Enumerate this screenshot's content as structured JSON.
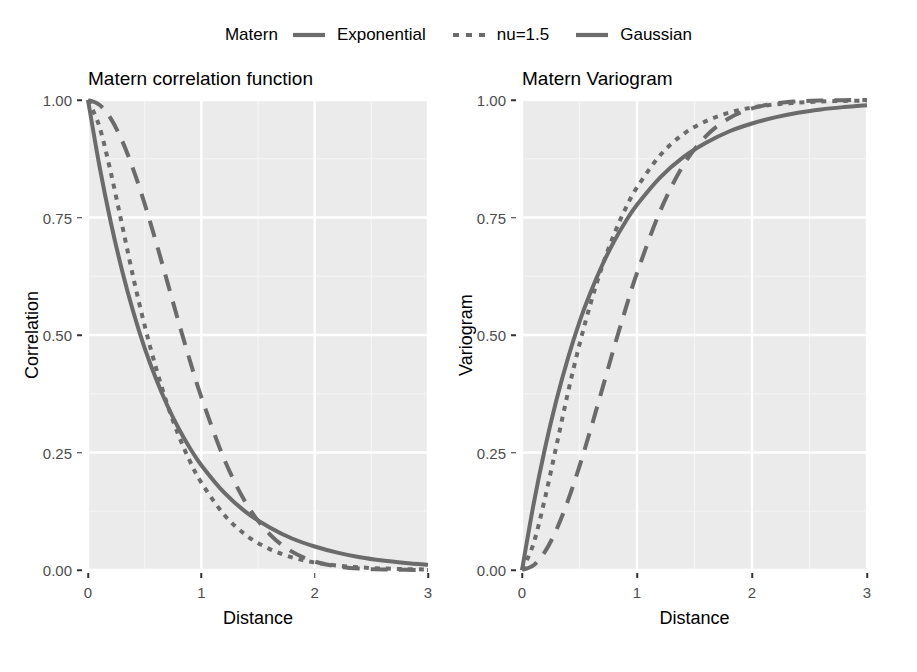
{
  "legend": {
    "title": "Matern",
    "entries": [
      {
        "label": "Exponential",
        "dash": "solid",
        "color": "#6b6b6b"
      },
      {
        "label": "nu=1.5",
        "dash": "dotted",
        "color": "#6b6b6b"
      },
      {
        "label": "Gaussian",
        "dash": "dashed",
        "color": "#6b6b6b"
      }
    ]
  },
  "panels": {
    "left": {
      "title": "Matern correlation function",
      "xlabel": "Distance",
      "ylabel": "Correlation"
    },
    "right": {
      "title": "Matern Variogram",
      "xlabel": "Distance",
      "ylabel": "Variogram"
    }
  },
  "colors": {
    "panel_background": "#ebebeb",
    "grid_major": "#ffffff",
    "grid_minor": "#f5f5f5",
    "line": "#6b6b6b",
    "tick_text": "#4d4d4d",
    "title_text": "#000000"
  },
  "chart_data": [
    {
      "type": "line",
      "title": "Matern correlation function",
      "xlabel": "Distance",
      "ylabel": "Correlation",
      "xlim": [
        0,
        3
      ],
      "ylim": [
        0,
        1
      ],
      "xticks": [
        "0",
        "1",
        "2",
        "3"
      ],
      "xtick_values": [
        0,
        1,
        2,
        3
      ],
      "yticks": [
        "0.00",
        "0.25",
        "0.50",
        "0.75",
        "1.00"
      ],
      "ytick_values": [
        0,
        0.25,
        0.5,
        0.75,
        1
      ],
      "grid": true,
      "legend_position": "top",
      "x": [
        0,
        0.1,
        0.2,
        0.3,
        0.4,
        0.5,
        0.6,
        0.7,
        0.8,
        0.9,
        1.0,
        1.2,
        1.4,
        1.6,
        1.8,
        2.0,
        2.2,
        2.4,
        2.6,
        2.8,
        3.0
      ],
      "series": [
        {
          "name": "Exponential",
          "dash": "solid",
          "values": [
            1.0,
            0.861,
            0.741,
            0.638,
            0.549,
            0.472,
            0.407,
            0.35,
            0.301,
            0.259,
            0.223,
            0.165,
            0.122,
            0.091,
            0.067,
            0.05,
            0.037,
            0.027,
            0.02,
            0.015,
            0.011
          ]
        },
        {
          "name": "nu=1.5",
          "dash": "dotted",
          "values": [
            1.0,
            0.944,
            0.847,
            0.735,
            0.622,
            0.52,
            0.43,
            0.352,
            0.286,
            0.231,
            0.186,
            0.118,
            0.073,
            0.045,
            0.027,
            0.016,
            0.0095,
            0.0056,
            0.0032,
            0.0019,
            0.0011
          ]
        },
        {
          "name": "Gaussian",
          "dash": "dashed",
          "values": [
            1.0,
            0.99,
            0.961,
            0.914,
            0.852,
            0.779,
            0.698,
            0.613,
            0.527,
            0.445,
            0.368,
            0.237,
            0.14,
            0.077,
            0.039,
            0.018,
            0.0076,
            0.003,
            0.0011,
            0.00035,
            0.0001
          ]
        }
      ]
    },
    {
      "type": "line",
      "title": "Matern Variogram",
      "xlabel": "Distance",
      "ylabel": "Variogram",
      "xlim": [
        0,
        3
      ],
      "ylim": [
        0,
        1
      ],
      "xticks": [
        "0",
        "1",
        "2",
        "3"
      ],
      "xtick_values": [
        0,
        1,
        2,
        3
      ],
      "yticks": [
        "0.00",
        "0.25",
        "0.50",
        "0.75",
        "1.00"
      ],
      "ytick_values": [
        0,
        0.25,
        0.5,
        0.75,
        1
      ],
      "grid": true,
      "legend_position": "top",
      "x": [
        0,
        0.1,
        0.2,
        0.3,
        0.4,
        0.5,
        0.6,
        0.7,
        0.8,
        0.9,
        1.0,
        1.2,
        1.4,
        1.6,
        1.8,
        2.0,
        2.2,
        2.4,
        2.6,
        2.8,
        3.0
      ],
      "series": [
        {
          "name": "Exponential",
          "dash": "solid",
          "values": [
            0.0,
            0.139,
            0.259,
            0.362,
            0.451,
            0.528,
            0.593,
            0.65,
            0.699,
            0.741,
            0.777,
            0.835,
            0.878,
            0.909,
            0.933,
            0.95,
            0.963,
            0.973,
            0.98,
            0.985,
            0.989
          ]
        },
        {
          "name": "nu=1.5",
          "dash": "dotted",
          "values": [
            0.0,
            0.056,
            0.153,
            0.265,
            0.378,
            0.48,
            0.57,
            0.648,
            0.714,
            0.769,
            0.814,
            0.882,
            0.927,
            0.955,
            0.973,
            0.984,
            0.9905,
            0.9944,
            0.9968,
            0.9981,
            0.9989
          ]
        },
        {
          "name": "Gaussian",
          "dash": "dashed",
          "values": [
            0.0,
            0.01,
            0.039,
            0.086,
            0.148,
            0.221,
            0.302,
            0.387,
            0.473,
            0.555,
            0.632,
            0.763,
            0.86,
            0.923,
            0.961,
            0.982,
            0.9924,
            0.997,
            0.9989,
            0.99965,
            0.9999
          ]
        }
      ]
    }
  ]
}
